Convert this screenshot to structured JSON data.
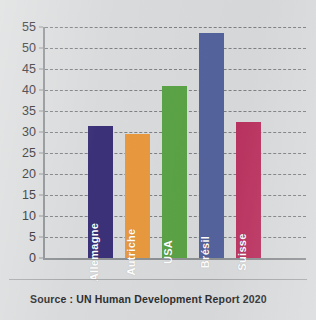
{
  "figure": {
    "cut_title": "",
    "source_caption": "Source : UN Human Development Report 2020",
    "background_color": "#d9dadb",
    "axis_color": "#8e9194",
    "gridline_color": "#6e7275"
  },
  "chart_data": {
    "type": "bar",
    "title": "",
    "xlabel": "",
    "ylabel": "",
    "ylim": [
      0,
      55
    ],
    "ytick_step": 5,
    "grid": true,
    "grid_style": "dashed-horizontal",
    "legend": "none",
    "labels_inside_bars": true,
    "label_rotation_deg": -90,
    "ytick_labels": [
      "0",
      "5",
      "10",
      "15",
      "20",
      "25",
      "30",
      "35",
      "40",
      "45",
      "50",
      "55"
    ],
    "categories": [
      "Allemagne",
      "Autriche",
      "USA",
      "Brésil",
      "Suisse"
    ],
    "values": [
      31.5,
      29.5,
      41.0,
      53.5,
      32.3
    ],
    "colors": [
      "#3b3178",
      "#e8993f",
      "#5ba346",
      "#55639e",
      "#bb3360"
    ],
    "bars": [
      {
        "label": "Allemagne",
        "value": 31.5,
        "color": "#3b3178"
      },
      {
        "label": "Autriche",
        "value": 29.5,
        "color": "#e8993f"
      },
      {
        "label": "USA",
        "value": 41.0,
        "color": "#5ba346"
      },
      {
        "label": "Brésil",
        "value": 53.5,
        "color": "#55639e"
      },
      {
        "label": "Suisse",
        "value": 32.3,
        "color": "#bb3360"
      }
    ]
  }
}
